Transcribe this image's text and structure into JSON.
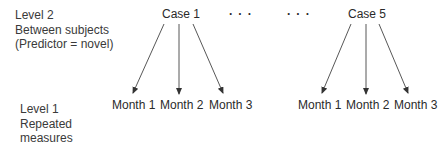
{
  "diagram": {
    "level2": {
      "lines": [
        "Level 2",
        "Between subjects",
        "(Predictor = novel)"
      ]
    },
    "level1": {
      "lines": [
        "Level 1",
        "Repeated",
        "measures"
      ]
    },
    "cases": [
      {
        "label": "Case 1",
        "children": [
          "Month 1",
          "Month 2",
          "Month 3"
        ]
      },
      {
        "label": "Case 5",
        "children": [
          "Month 1",
          "Month 2",
          "Month 3"
        ]
      }
    ],
    "ellipses": [
      "· · ·",
      "· · ·"
    ],
    "colors": {
      "text": "#2a2a2a",
      "arrow": "#333333",
      "background": "#ffffff"
    }
  }
}
